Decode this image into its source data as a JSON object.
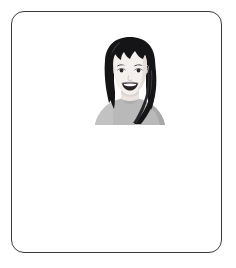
{
  "page": {
    "background_color": "#ffffff",
    "width": 236,
    "height": 268
  },
  "frame": {
    "name": "rounded-border-frame",
    "border_color": "#3a3a3c",
    "border_width_px": 1,
    "corner_radius_px": 13,
    "fill_color": "#ffffff",
    "left_px": 11,
    "top_px": 11,
    "width_px": 211,
    "height_px": 242
  },
  "avatar": {
    "name": "woman-avatar-illustration",
    "alt_text": "Illustration of a smiling woman with long straight black hair and blunt bangs, wearing a light gray top",
    "left_px": 82,
    "top_px": 24,
    "width_px": 72,
    "height_px": 89,
    "colors": {
      "hair": "#151517",
      "hair_highlight": "#4a4a50",
      "skin": "#f2eeec",
      "skin_shadow": "#ded6d2",
      "outline": "#6e6a68",
      "shirt": "#b9b9b9",
      "shirt_shadow": "#a6a6a6",
      "neck_shadow": "#dcd4d0",
      "eye": "#2a2a2e",
      "eyebrow": "#2e2c30",
      "mouth": "#2b2226",
      "teeth": "#ffffff",
      "lip": "#8e7a80"
    },
    "features": [
      "long-black-hair",
      "blunt-bangs",
      "eyebrows",
      "eyes",
      "nose",
      "open-smile-mouth",
      "teeth",
      "neck",
      "gray-shirt-shoulders"
    ]
  },
  "content": {
    "body_text": "",
    "caption": ""
  }
}
